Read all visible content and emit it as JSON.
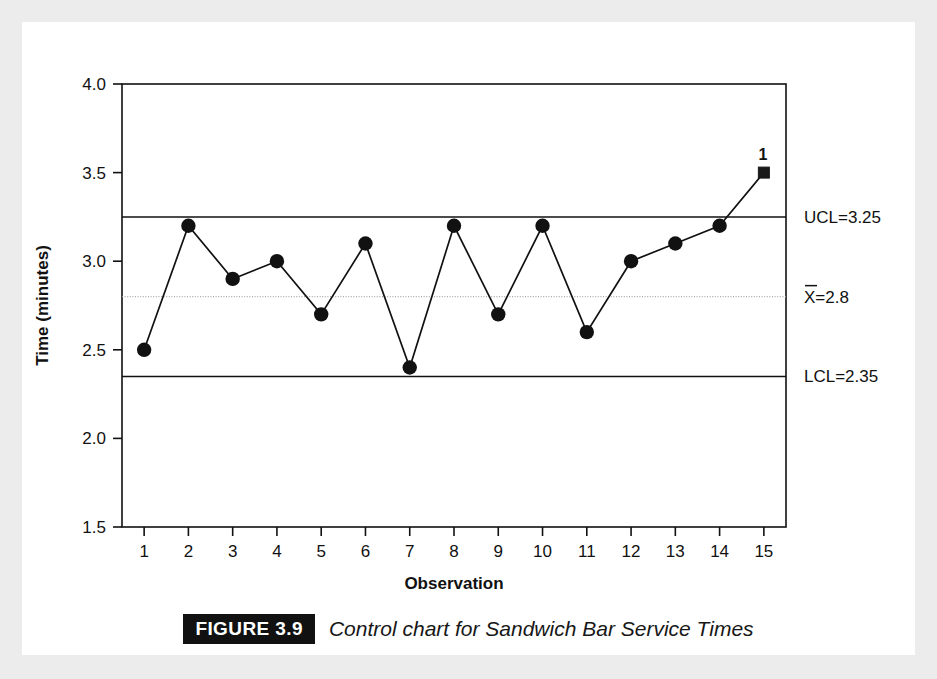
{
  "figure": {
    "badge": "FIGURE 3.9",
    "caption": "Control chart for Sandwich Bar Service Times"
  },
  "chart_data": {
    "type": "line",
    "title": "",
    "xlabel": "Observation",
    "ylabel": "Time (minutes)",
    "x": [
      1,
      2,
      3,
      4,
      5,
      6,
      7,
      8,
      9,
      10,
      11,
      12,
      13,
      14,
      15
    ],
    "values": [
      2.5,
      3.2,
      2.9,
      3.0,
      2.7,
      3.1,
      2.4,
      3.2,
      2.7,
      3.2,
      2.6,
      3.0,
      3.1,
      3.2,
      3.5
    ],
    "xlim": [
      0.5,
      15.5
    ],
    "ylim": [
      1.5,
      4.0
    ],
    "ytick_labels": [
      "4.0",
      "3.5",
      "3.0",
      "2.5",
      "2.0",
      "1.5"
    ],
    "ytick_values": [
      4.0,
      3.5,
      3.0,
      2.5,
      2.0,
      1.5
    ],
    "xtick_labels": [
      "1",
      "2",
      "3",
      "4",
      "5",
      "6",
      "7",
      "8",
      "9",
      "10",
      "11",
      "12",
      "13",
      "14",
      "15"
    ],
    "grid": false,
    "legend": "none",
    "marker": "circle",
    "violation_marker": "square",
    "violation_index": 15,
    "violation_label": "1",
    "control_limits": [
      {
        "name": "UCL",
        "label": "UCL=3.25",
        "value": 3.25,
        "style": "solid",
        "color": "#111111"
      },
      {
        "name": "center",
        "label": "X̄0=2.8",
        "value": 2.8,
        "style": "light",
        "color": "#9a9a9a"
      },
      {
        "name": "LCL",
        "label": "LCL=2.35",
        "value": 2.35,
        "style": "solid",
        "color": "#111111"
      }
    ],
    "center_label_parts": {
      "symbol": "X",
      "overbar": true,
      "rest": "=2.8"
    }
  }
}
